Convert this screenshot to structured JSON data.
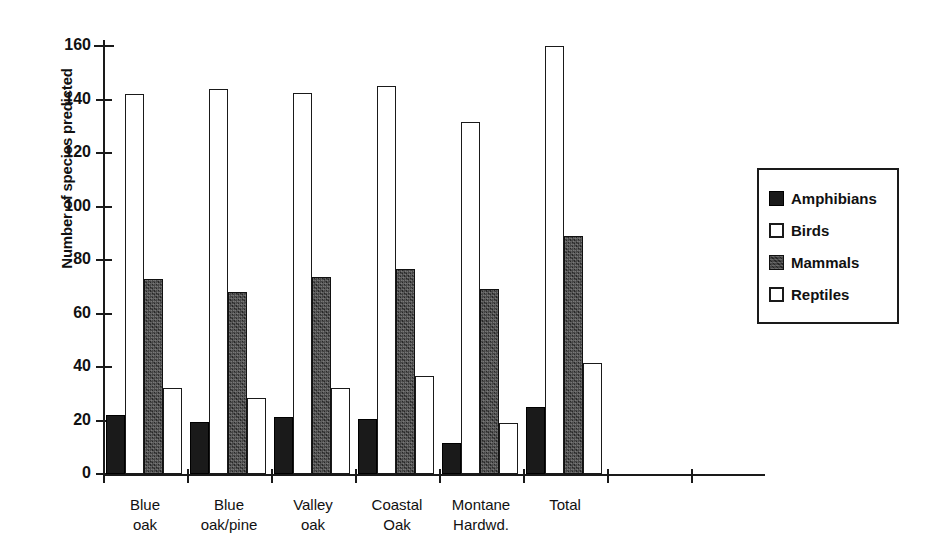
{
  "chart_data": {
    "type": "bar",
    "title": "",
    "xlabel": "",
    "ylabel": "Number of species predicted",
    "ylim": [
      0,
      160
    ],
    "yticks": [
      0,
      20,
      40,
      60,
      80,
      100,
      120,
      140,
      160
    ],
    "grid": false,
    "legend_position": "right",
    "categories": [
      "Blue oak",
      "Blue oak/pine",
      "Valley oak",
      "Coastal Oak",
      "Montane Hardwd.",
      "Total"
    ],
    "series": [
      {
        "name": "Amphibians",
        "color": "#1a1a1a",
        "fill": "solid-black",
        "values": [
          22,
          19.5,
          21.5,
          20.5,
          11.5,
          25
        ]
      },
      {
        "name": "Birds",
        "color": "#ffffff",
        "fill": "white-outline",
        "values": [
          142,
          144,
          142.5,
          145,
          131.5,
          160
        ]
      },
      {
        "name": "Mammals",
        "color": "#3c3c3c",
        "fill": "dark-texture",
        "values": [
          73,
          68,
          73.5,
          76.5,
          69,
          89
        ]
      },
      {
        "name": "Reptiles",
        "color": "#ffffff",
        "fill": "white-outline",
        "values": [
          32,
          28.5,
          32,
          36.5,
          19,
          41.5
        ]
      }
    ]
  },
  "legend": {
    "items": [
      {
        "label": "Amphibians",
        "swatch": "amphibians"
      },
      {
        "label": "Birds",
        "swatch": "birds"
      },
      {
        "label": "Mammals",
        "swatch": "mammals"
      },
      {
        "label": "Reptiles",
        "swatch": "reptiles"
      }
    ]
  }
}
